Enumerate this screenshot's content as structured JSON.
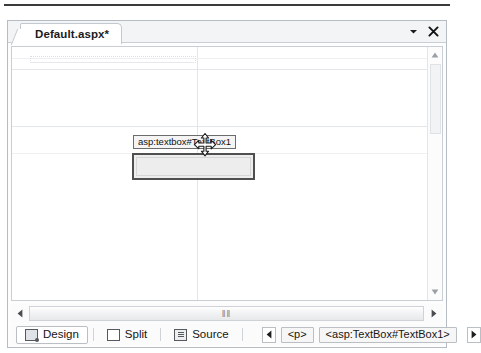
{
  "window": {
    "tab": {
      "label": "Default.aspx*",
      "dropdown_icon": "chevron-down-icon",
      "close_icon": "close-icon"
    }
  },
  "designer": {
    "selected_control": {
      "tag_badge": "asp:textbox#TextBox1",
      "cursor_icon": "move-cursor-icon"
    }
  },
  "scrollbars": {
    "vertical": {
      "up_icon": "scroll-up-arrow-icon",
      "down_icon": "scroll-down-arrow-icon"
    },
    "horizontal": {
      "left_icon": "scroll-left-arrow-icon",
      "right_icon": "scroll-right-arrow-icon",
      "grip": "‖‖"
    }
  },
  "view_tabs": [
    {
      "label": "Design",
      "icon": "design-view-icon",
      "active": true
    },
    {
      "label": "Split",
      "icon": "split-view-icon",
      "active": false
    },
    {
      "label": "Source",
      "icon": "source-view-icon",
      "active": false
    }
  ],
  "breadcrumb": {
    "prev_icon": "breadcrumb-prev-arrow-icon",
    "next_icon": "breadcrumb-next-arrow-icon",
    "items": [
      {
        "label": "<p>"
      },
      {
        "label": "<asp:TextBox#TextBox1>"
      }
    ]
  },
  "colors": {
    "frame_border": "#b5bcc4",
    "tab_background": "#f3f4f6",
    "control_border": "#4f4f4f",
    "control_fill": "#ededed",
    "badge_border": "#6c6c6c"
  }
}
